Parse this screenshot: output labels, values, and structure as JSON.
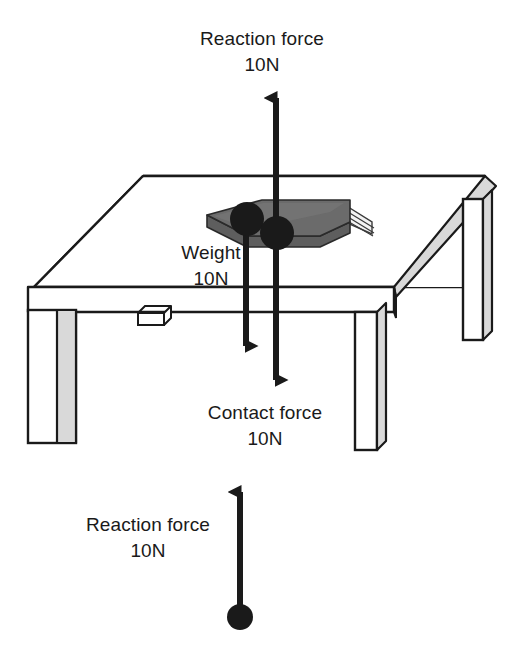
{
  "figure": {
    "background_color": "#ffffff",
    "line_color": "#1a1a1a",
    "arrow_color": "#1a1a1a",
    "book_cover_color": "#595959",
    "book_page_color": "#e8e8e8",
    "table_face_color": "#ffffff",
    "table_shade_color": "#d9d9d9"
  },
  "forces": {
    "reaction_top": {
      "label": "Reaction force",
      "value": "10N",
      "direction": "up",
      "applied_at": "book",
      "magnitude_newtons": 10
    },
    "weight": {
      "label": "Weight",
      "value": "10N",
      "direction": "down",
      "applied_at": "book",
      "magnitude_newtons": 10
    },
    "contact": {
      "label": "Contact force",
      "value": "10N",
      "direction": "down",
      "applied_at": "table",
      "magnitude_newtons": 10
    },
    "reaction_bottom": {
      "label": "Reaction force",
      "value": "10N",
      "direction": "up",
      "applied_at": "ground",
      "magnitude_newtons": 10
    }
  },
  "objects": {
    "table": "table",
    "book": "book",
    "drawer_handle": "drawer handle"
  },
  "caption": {
    "clipped_text": "..."
  }
}
